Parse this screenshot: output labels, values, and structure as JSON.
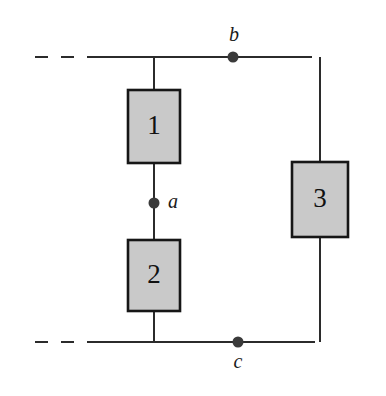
{
  "figure": {
    "type": "circuit-diagram",
    "title": "",
    "background_color": "#ffffff",
    "width": 386,
    "height": 396
  },
  "style": {
    "wire_color": "#2b2b2b",
    "wire_width": 2,
    "box_fill": "#c9c9c9",
    "box_stroke": "#161616",
    "box_stroke_width": 2.6,
    "node_dot_color": "#3a3a3a",
    "node_dot_radius": 5.5,
    "dash_pattern": "13 13"
  },
  "components": [
    {
      "id": "component-1",
      "label": "1",
      "x": 128,
      "y": 90,
      "width": 52,
      "height": 73,
      "branch": "left"
    },
    {
      "id": "component-2",
      "label": "2",
      "x": 128,
      "y": 240,
      "width": 52,
      "height": 71,
      "branch": "left"
    },
    {
      "id": "component-3",
      "label": "3",
      "x": 292,
      "y": 162,
      "width": 56,
      "height": 75,
      "branch": "right"
    }
  ],
  "nodes": [
    {
      "id": "node-a",
      "label": "a",
      "cx": 154,
      "cy": 203,
      "label_x": 173,
      "label_y": 203,
      "label_position": "right"
    },
    {
      "id": "node-b",
      "label": "b",
      "cx": 233,
      "cy": 57,
      "label_x": 234,
      "label_y": 36,
      "label_position": "above"
    },
    {
      "id": "node-c",
      "label": "c",
      "cx": 238,
      "cy": 342,
      "label_x": 238,
      "label_y": 363,
      "label_position": "below"
    }
  ],
  "wires": {
    "top_rail_y": 57,
    "bottom_rail_y": 342,
    "left_branch_x": 154,
    "right_branch_x": 320,
    "top_rail_dashed_start_x": 35,
    "top_rail_dashed_end_x": 95,
    "top_rail_solid_end_x": 312,
    "bottom_rail_dashed_start_x": 35,
    "bottom_rail_dashed_end_x": 95,
    "bottom_rail_solid_end_x": 315,
    "right_corner_top_x": 312,
    "right_corner_bottom_x": 315
  }
}
